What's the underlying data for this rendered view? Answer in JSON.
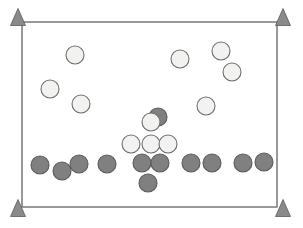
{
  "scene": {
    "title": "Field Position Diagram",
    "width": 303,
    "height": 228,
    "background_color": "#ffffff"
  },
  "field": {
    "label": "field-boundary",
    "x": 22,
    "y": 22,
    "width": 255,
    "height": 185,
    "stroke_color": "#6e6e6e",
    "stroke_width": 1.4,
    "fill_color": "#ffffff"
  },
  "cones": {
    "label": "corner-cone-markers",
    "fill_color": "#8a8a8a",
    "stroke_color": "#5a5a5a",
    "count": 4,
    "items": [
      {
        "name": "cone-top-left",
        "cx": 18,
        "cy": 17,
        "w": 15,
        "h": 17
      },
      {
        "name": "cone-top-right",
        "cx": 283,
        "cy": 17,
        "w": 15,
        "h": 17
      },
      {
        "name": "cone-bottom-left",
        "cx": 18,
        "cy": 208,
        "w": 15,
        "h": 17
      },
      {
        "name": "cone-bottom-right",
        "cx": 283,
        "cy": 208,
        "w": 15,
        "h": 17
      }
    ]
  },
  "teams": {
    "light": {
      "name": "light-team",
      "fill_color": "#f2f2f0",
      "stroke_color": "#6e6e6e",
      "count": 10
    },
    "dark": {
      "name": "dark-team",
      "fill_color": "#808080",
      "stroke_color": "#5a5a5a",
      "count": 14
    }
  },
  "players": [
    {
      "name": "light-player-1",
      "team": "light",
      "cx": 75,
      "cy": 55,
      "r": 9
    },
    {
      "name": "light-player-2",
      "team": "light",
      "cx": 50,
      "cy": 89,
      "r": 9
    },
    {
      "name": "light-player-3",
      "team": "light",
      "cx": 81,
      "cy": 104,
      "r": 9
    },
    {
      "name": "light-player-4",
      "team": "light",
      "cx": 180,
      "cy": 59,
      "r": 9
    },
    {
      "name": "light-player-5",
      "team": "light",
      "cx": 221,
      "cy": 51,
      "r": 9
    },
    {
      "name": "light-player-6",
      "team": "light",
      "cx": 232,
      "cy": 72,
      "r": 9
    },
    {
      "name": "light-player-7",
      "team": "light",
      "cx": 206,
      "cy": 106,
      "r": 9
    },
    {
      "name": "dark-player-1",
      "team": "dark",
      "cx": 158,
      "cy": 117,
      "r": 9
    },
    {
      "name": "light-player-8",
      "team": "light",
      "cx": 151,
      "cy": 122,
      "r": 9
    },
    {
      "name": "light-player-9",
      "team": "light",
      "cx": 131,
      "cy": 144,
      "r": 9
    },
    {
      "name": "light-player-10",
      "team": "light",
      "cx": 151,
      "cy": 144,
      "r": 9
    },
    {
      "name": "light-player-11",
      "team": "light",
      "cx": 168,
      "cy": 144,
      "r": 9
    },
    {
      "name": "dark-player-2",
      "team": "dark",
      "cx": 142,
      "cy": 163,
      "r": 9
    },
    {
      "name": "dark-player-3",
      "team": "dark",
      "cx": 160,
      "cy": 163,
      "r": 9
    },
    {
      "name": "dark-player-4",
      "team": "dark",
      "cx": 148,
      "cy": 183,
      "r": 9
    },
    {
      "name": "dark-player-5",
      "team": "dark",
      "cx": 40,
      "cy": 165,
      "r": 9
    },
    {
      "name": "dark-player-6",
      "team": "dark",
      "cx": 62,
      "cy": 171,
      "r": 9
    },
    {
      "name": "dark-player-7",
      "team": "dark",
      "cx": 79,
      "cy": 164,
      "r": 9
    },
    {
      "name": "dark-player-8",
      "team": "dark",
      "cx": 107,
      "cy": 164,
      "r": 9
    },
    {
      "name": "dark-player-9",
      "team": "dark",
      "cx": 191,
      "cy": 163,
      "r": 9
    },
    {
      "name": "dark-player-10",
      "team": "dark",
      "cx": 212,
      "cy": 163,
      "r": 9
    },
    {
      "name": "dark-player-11",
      "team": "dark",
      "cx": 243,
      "cy": 163,
      "r": 9
    },
    {
      "name": "dark-player-12",
      "team": "dark",
      "cx": 264,
      "cy": 162,
      "r": 9
    }
  ]
}
